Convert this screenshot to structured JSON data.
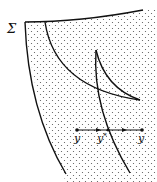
{
  "diagram": {
    "region_label": "Σ",
    "points": [
      {
        "id": "y",
        "label": "y",
        "sup": ""
      },
      {
        "id": "y_star",
        "label": "y",
        "sup": "*"
      },
      {
        "id": "y_prime",
        "label": "y",
        "sup": "′"
      }
    ],
    "fill": "stippled",
    "colors": {
      "stroke": "#111111",
      "dots": "#555555",
      "background": "#ffffff"
    }
  }
}
